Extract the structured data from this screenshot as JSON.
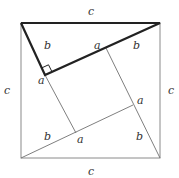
{
  "diagram": {
    "title": "",
    "colors": {
      "thin_line": "#707070",
      "thick_line": "#222222",
      "label": "#333333"
    },
    "labels": {
      "top_c": "c",
      "left_c": "c",
      "right_c": "c",
      "bottom_c": "c",
      "tri_top_b_left": "b",
      "tri_top_a_mid": "a",
      "tri_top_b_right": "b",
      "tri_left_a": "a",
      "tri_right_a": "a",
      "tri_bottom_b": "b",
      "tri_bottom_a": "a",
      "tri_right_b": "b"
    }
  }
}
